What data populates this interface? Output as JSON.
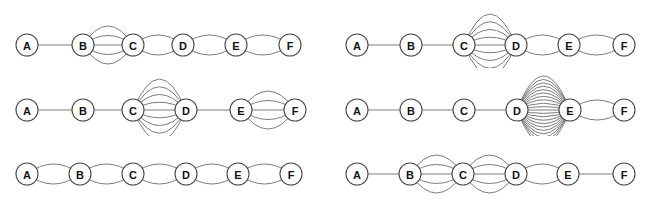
{
  "figure": {
    "title": "",
    "background_color": "#ffffff",
    "node_fill_color": "#ffffff",
    "node_stroke_color": "#4a4a4a",
    "edge_color": "#6e6e6e",
    "label_color": "#121212",
    "node_radius": 11,
    "columns": 2,
    "rows": 3
  },
  "chart_data": {
    "type": "diagram",
    "diagram_type": "multigraph-series",
    "node_labels": [
      "A",
      "B",
      "C",
      "D",
      "E",
      "F"
    ],
    "panels": [
      {
        "id": "panel-1",
        "position": "top-left",
        "origin": [
          0,
          0
        ],
        "size": [
          327,
          68
        ],
        "node_x": [
          27,
          83,
          133,
          183,
          236,
          290
        ],
        "node_y": 45,
        "edges": [
          {
            "from": "A",
            "to": "B",
            "multiplicity": 1
          },
          {
            "from": "B",
            "to": "C",
            "multiplicity": 5
          },
          {
            "from": "C",
            "to": "D",
            "multiplicity": 2
          },
          {
            "from": "D",
            "to": "E",
            "multiplicity": 2
          },
          {
            "from": "E",
            "to": "F",
            "multiplicity": 2
          }
        ]
      },
      {
        "id": "panel-2",
        "position": "middle-left",
        "origin": [
          0,
          68
        ],
        "size": [
          327,
          68
        ],
        "node_x": [
          27,
          83,
          133,
          186,
          241,
          295
        ],
        "node_y": 42,
        "edges": [
          {
            "from": "A",
            "to": "B",
            "multiplicity": 1
          },
          {
            "from": "B",
            "to": "C",
            "multiplicity": 1
          },
          {
            "from": "C",
            "to": "D",
            "multiplicity": 9
          },
          {
            "from": "D",
            "to": "E",
            "multiplicity": 1
          },
          {
            "from": "E",
            "to": "F",
            "multiplicity": 5
          }
        ]
      },
      {
        "id": "panel-3",
        "position": "bottom-left",
        "origin": [
          0,
          136
        ],
        "size": [
          327,
          67
        ],
        "node_x": [
          27,
          80,
          133,
          186,
          238,
          291
        ],
        "node_y": 38,
        "edges": [
          {
            "from": "A",
            "to": "B",
            "multiplicity": 2
          },
          {
            "from": "B",
            "to": "C",
            "multiplicity": 2
          },
          {
            "from": "C",
            "to": "D",
            "multiplicity": 2
          },
          {
            "from": "D",
            "to": "E",
            "multiplicity": 2
          },
          {
            "from": "E",
            "to": "F",
            "multiplicity": 2
          }
        ]
      },
      {
        "id": "panel-4",
        "position": "top-right",
        "origin": [
          330,
          0
        ],
        "size": [
          327,
          68
        ],
        "node_x": [
          27,
          81,
          134,
          186,
          239,
          294
        ],
        "node_y": 45,
        "edges": [
          {
            "from": "A",
            "to": "B",
            "multiplicity": 1
          },
          {
            "from": "B",
            "to": "C",
            "multiplicity": 1
          },
          {
            "from": "C",
            "to": "D",
            "multiplicity": 9
          },
          {
            "from": "D",
            "to": "E",
            "multiplicity": 2
          },
          {
            "from": "E",
            "to": "F",
            "multiplicity": 2
          }
        ]
      },
      {
        "id": "panel-5",
        "position": "middle-right",
        "origin": [
          330,
          68
        ],
        "size": [
          327,
          68
        ],
        "node_x": [
          27,
          81,
          134,
          187,
          240,
          294
        ],
        "node_y": 42,
        "edges": [
          {
            "from": "A",
            "to": "B",
            "multiplicity": 1
          },
          {
            "from": "B",
            "to": "C",
            "multiplicity": 1
          },
          {
            "from": "C",
            "to": "D",
            "multiplicity": 1
          },
          {
            "from": "D",
            "to": "E",
            "multiplicity": 21
          },
          {
            "from": "E",
            "to": "F",
            "multiplicity": 2
          }
        ]
      },
      {
        "id": "panel-6",
        "position": "bottom-right",
        "origin": [
          330,
          136
        ],
        "size": [
          327,
          67
        ],
        "node_x": [
          27,
          80,
          133,
          186,
          238,
          294
        ],
        "node_y": 38,
        "edges": [
          {
            "from": "A",
            "to": "B",
            "multiplicity": 1
          },
          {
            "from": "B",
            "to": "C",
            "multiplicity": 5
          },
          {
            "from": "C",
            "to": "D",
            "multiplicity": 5
          },
          {
            "from": "D",
            "to": "E",
            "multiplicity": 2
          },
          {
            "from": "E",
            "to": "F",
            "multiplicity": 1
          }
        ]
      }
    ]
  }
}
